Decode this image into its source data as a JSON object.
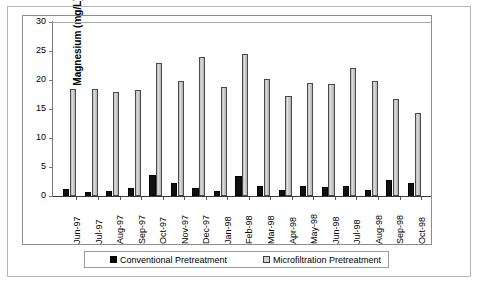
{
  "chart_data": {
    "type": "bar",
    "title": "",
    "xlabel": "",
    "ylabel": "Magnesium (mg/L)",
    "ylim": [
      0,
      30
    ],
    "yticks": [
      0,
      5,
      10,
      15,
      20,
      25,
      30
    ],
    "grid": false,
    "legend_position": "bottom",
    "categories": [
      "Jun-97",
      "Jul-97",
      "Aug-97",
      "Sep-97",
      "Oct-97",
      "Nov-97",
      "Dec-97",
      "Jan-98",
      "Feb-98",
      "Mar-98",
      "Apr-98",
      "May-98",
      "Jun-98",
      "Jul-98",
      "Aug-98",
      "Sep-98",
      "Oct-98"
    ],
    "series": [
      {
        "name": "Conventional Pretreatment",
        "color": "#000000",
        "values": [
          1.2,
          0.7,
          0.9,
          1.3,
          3.7,
          2.2,
          1.4,
          0.9,
          3.4,
          1.7,
          1.0,
          1.7,
          1.5,
          1.7,
          1.1,
          2.7,
          2.3
        ]
      },
      {
        "name": "Microfiltration Pretreatment",
        "color": "#cccccc",
        "values": [
          18.5,
          18.5,
          18.0,
          18.3,
          23.0,
          19.8,
          24.0,
          18.8,
          24.5,
          20.2,
          17.3,
          19.5,
          19.3,
          22.0,
          19.8,
          16.8,
          14.3
        ]
      }
    ]
  },
  "legend": {
    "entries": [
      {
        "label": "Conventional Pretreatment"
      },
      {
        "label": "Microfiltration Pretreatment"
      }
    ]
  }
}
